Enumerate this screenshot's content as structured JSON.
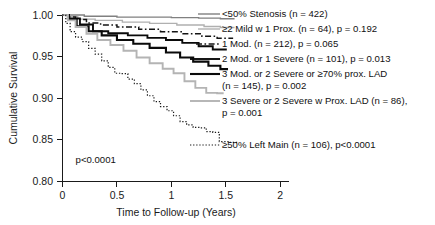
{
  "chart_data": {
    "type": "line",
    "title": "",
    "xlabel": "Time to Follow-up (Years)",
    "ylabel": "Cumulative Survival",
    "xlim": [
      0,
      2.08
    ],
    "ylim": [
      0.8,
      1.0
    ],
    "grid": false,
    "legend_position": "right-inline",
    "x_ticks": [
      "0",
      "0.5",
      "1",
      "1.5",
      "2"
    ],
    "x_tick_values": [
      0,
      0.5,
      1,
      1.5,
      2
    ],
    "y_ticks": [
      "0.80",
      "0.85",
      "0.90",
      "0.95",
      "1.00"
    ],
    "y_tick_values": [
      0.8,
      0.85,
      0.9,
      0.95,
      1.0
    ],
    "annotations": [
      {
        "name": "overall-p-value",
        "text": "p<0.0001",
        "x": 0.12,
        "y": 0.822
      }
    ],
    "series": [
      {
        "name": "<50% Stenosis",
        "label": "<50% Stenosis  (n = 422)",
        "n": 422,
        "p": null,
        "color": "#808080",
        "width": 1.4,
        "dash": "none",
        "label_x": 222,
        "label_y": 17,
        "points": [
          [
            0.0,
            1.0
          ],
          [
            0.08,
            1.0
          ],
          [
            0.2,
            0.9985
          ],
          [
            0.35,
            0.9985
          ],
          [
            0.5,
            0.9975
          ],
          [
            0.75,
            0.9975
          ],
          [
            1.0,
            0.9968
          ],
          [
            1.25,
            0.9962
          ],
          [
            1.45,
            0.9955
          ],
          [
            1.58,
            0.9955
          ]
        ]
      },
      {
        "name": "2 Mild w 1 Prox",
        "label": "≥2 Mild w 1 Prox. (n = 64), p = 0.192",
        "n": 64,
        "p": 0.192,
        "color": "#b0b0b0",
        "width": 1.4,
        "dash": "none",
        "label_x": 222,
        "label_y": 32,
        "points": [
          [
            0.0,
            1.0
          ],
          [
            0.06,
            0.998
          ],
          [
            0.14,
            0.995
          ],
          [
            0.3,
            0.9935
          ],
          [
            0.55,
            0.9915
          ],
          [
            0.8,
            0.99
          ],
          [
            1.05,
            0.988
          ],
          [
            1.3,
            0.9862
          ],
          [
            1.45,
            0.985
          ],
          [
            1.58,
            0.985
          ]
        ]
      },
      {
        "name": "1 Mod.",
        "label": "1 Mod. (n = 212), p = 0.065",
        "n": 212,
        "p": 0.065,
        "color": "#141414",
        "width": 1.5,
        "dash": "6,2.5,1.6,2.5",
        "label_x": 222,
        "label_y": 47,
        "points": [
          [
            0.0,
            1.0
          ],
          [
            0.05,
            0.9975
          ],
          [
            0.12,
            0.9945
          ],
          [
            0.22,
            0.9905
          ],
          [
            0.35,
            0.988
          ],
          [
            0.5,
            0.9855
          ],
          [
            0.7,
            0.9828
          ],
          [
            0.9,
            0.98
          ],
          [
            1.1,
            0.9775
          ],
          [
            1.28,
            0.9745
          ],
          [
            1.42,
            0.9722
          ],
          [
            1.56,
            0.9712
          ]
        ]
      },
      {
        "name": "2 Mod. or 1 Severe",
        "label": "2 Mod. or 1 Severe (n = 101), p = 0.013",
        "n": 101,
        "p": 0.013,
        "color": "#0a0a0a",
        "width": 1.9,
        "dash": "none",
        "label_x": 222,
        "label_y": 62,
        "points": [
          [
            0.0,
            1.0
          ],
          [
            0.06,
            0.996
          ],
          [
            0.16,
            0.9885
          ],
          [
            0.28,
            0.9805
          ],
          [
            0.42,
            0.978
          ],
          [
            0.6,
            0.9755
          ],
          [
            0.78,
            0.9725
          ],
          [
            0.95,
            0.97
          ],
          [
            1.1,
            0.9665
          ],
          [
            1.25,
            0.9625
          ],
          [
            1.38,
            0.9585
          ],
          [
            1.5,
            0.9575
          ]
        ]
      },
      {
        "name": "3 Mod. or 2 Severe or 70% prox. LAD",
        "label": "3 Mod. or 2 Severe or ≥70% prox. LAD",
        "label2": "(n = 145), p = 0.002",
        "n": 145,
        "p": 0.002,
        "color": "#0a0a0a",
        "width": 2.1,
        "dash": "none",
        "label_x": 222,
        "label_y": 77,
        "label2_x": 222,
        "label2_y": 89,
        "points": [
          [
            0.0,
            1.0
          ],
          [
            0.05,
            0.995
          ],
          [
            0.13,
            0.9865
          ],
          [
            0.24,
            0.9805
          ],
          [
            0.36,
            0.9755
          ],
          [
            0.5,
            0.97
          ],
          [
            0.65,
            0.9655
          ],
          [
            0.8,
            0.9605
          ],
          [
            0.95,
            0.955
          ],
          [
            1.08,
            0.949
          ],
          [
            1.2,
            0.944
          ],
          [
            1.34,
            0.939
          ],
          [
            1.45,
            0.935
          ],
          [
            1.52,
            0.935
          ]
        ]
      },
      {
        "name": "3 Severe or 2 Severe w Prox. LAD",
        "label": "3 Severe or 2 Severe w Prox. LAD (n = 86),",
        "label2": "p = 0.001",
        "n": 86,
        "p": 0.001,
        "color": "#b4b4b4",
        "width": 1.9,
        "dash": "none",
        "label_x": 222,
        "label_y": 104,
        "label2_x": 222,
        "label2_y": 116,
        "points": [
          [
            0.0,
            1.0
          ],
          [
            0.05,
            0.9935
          ],
          [
            0.12,
            0.9855
          ],
          [
            0.22,
            0.9775
          ],
          [
            0.32,
            0.97
          ],
          [
            0.44,
            0.964
          ],
          [
            0.56,
            0.957
          ],
          [
            0.68,
            0.949
          ],
          [
            0.8,
            0.942
          ],
          [
            0.92,
            0.9355
          ],
          [
            1.02,
            0.93
          ],
          [
            1.12,
            0.9205
          ],
          [
            1.22,
            0.9125
          ],
          [
            1.32,
            0.9065
          ],
          [
            1.42,
            0.906
          ],
          [
            1.48,
            0.906
          ]
        ]
      },
      {
        "name": "50% Left Main",
        "label": "≥50% Left Main (n = 106), p<0.0001",
        "n": 106,
        "p": 0.0001,
        "color": "#1a1a1a",
        "width": 1.2,
        "dash": "1.3,1.8",
        "label_x": 222,
        "label_y": 148,
        "points": [
          [
            0.0,
            1.0
          ],
          [
            0.03,
            0.99
          ],
          [
            0.07,
            0.98
          ],
          [
            0.12,
            0.9735
          ],
          [
            0.18,
            0.968
          ],
          [
            0.24,
            0.96
          ],
          [
            0.3,
            0.953
          ],
          [
            0.36,
            0.945
          ],
          [
            0.42,
            0.937
          ],
          [
            0.48,
            0.93
          ],
          [
            0.54,
            0.9295
          ],
          [
            0.6,
            0.923
          ],
          [
            0.66,
            0.9175
          ],
          [
            0.72,
            0.91
          ],
          [
            0.78,
            0.903
          ],
          [
            0.84,
            0.896
          ],
          [
            0.9,
            0.89
          ],
          [
            0.96,
            0.885
          ],
          [
            1.02,
            0.879
          ],
          [
            1.08,
            0.872
          ],
          [
            1.14,
            0.868
          ],
          [
            1.2,
            0.865
          ],
          [
            1.26,
            0.8645
          ],
          [
            1.32,
            0.86
          ],
          [
            1.38,
            0.859
          ],
          [
            1.44,
            0.848
          ],
          [
            1.54,
            0.847
          ],
          [
            1.62,
            0.847
          ]
        ]
      }
    ]
  },
  "legend_samples": [
    {
      "series": 0,
      "x1": 198,
      "x2": 220,
      "y": 14
    },
    {
      "series": 1,
      "x1": 198,
      "x2": 220,
      "y": 29
    },
    {
      "series": 2,
      "x1": 196,
      "x2": 220,
      "y": 44
    },
    {
      "series": 3,
      "x1": 190,
      "x2": 220,
      "y": 59
    },
    {
      "series": 4,
      "x1": 190,
      "x2": 220,
      "y": 74
    },
    {
      "series": 5,
      "x1": 190,
      "x2": 220,
      "y": 101
    },
    {
      "series": 6,
      "x1": 190,
      "x2": 220,
      "y": 145
    }
  ]
}
